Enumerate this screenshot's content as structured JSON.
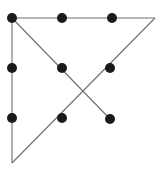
{
  "figure": {
    "type": "node-link-diagram",
    "canvas": {
      "width": 160,
      "height": 180,
      "background_color": "#ffffff"
    },
    "style": {
      "line_color": "#6e6e6e",
      "line_width": 1.1,
      "dot_color": "#1a1a1a",
      "dot_radius": 5
    },
    "nodes": [
      {
        "id": "n1",
        "label": "top-left",
        "x": 12,
        "y": 18,
        "marker": "dot"
      },
      {
        "id": "n2",
        "label": "top-middle",
        "x": 62,
        "y": 18,
        "marker": "dot"
      },
      {
        "id": "n3",
        "label": "top-right-inner",
        "x": 112,
        "y": 18,
        "marker": "dot"
      },
      {
        "id": "n4",
        "label": "left-middle",
        "x": 12,
        "y": 68,
        "marker": "dot"
      },
      {
        "id": "n5",
        "label": "center",
        "x": 62,
        "y": 68,
        "marker": "dot"
      },
      {
        "id": "n6",
        "label": "right-middle",
        "x": 110,
        "y": 68,
        "marker": "dot"
      },
      {
        "id": "n7",
        "label": "left-lower",
        "x": 12,
        "y": 118,
        "marker": "dot"
      },
      {
        "id": "n8",
        "label": "bottom-middle",
        "x": 62,
        "y": 118,
        "marker": "dot"
      },
      {
        "id": "n9",
        "label": "lower-right",
        "x": 110,
        "y": 119,
        "marker": "dot"
      }
    ],
    "corners": [
      {
        "id": "c1",
        "label": "top-right-corner",
        "x": 155,
        "y": 18,
        "marker": "none"
      },
      {
        "id": "c2",
        "label": "bottom-left-corner",
        "x": 12,
        "y": 163,
        "marker": "none"
      }
    ],
    "edges": [
      {
        "id": "e1",
        "label": "top-horizontal",
        "x1": 12,
        "y1": 18,
        "x2": 155,
        "y2": 18
      },
      {
        "id": "e2",
        "label": "left-vertical",
        "x1": 12,
        "y1": 18,
        "x2": 12,
        "y2": 163
      },
      {
        "id": "e3",
        "label": "diagonal-nw-se",
        "x1": 12,
        "y1": 18,
        "x2": 110,
        "y2": 119
      },
      {
        "id": "e4",
        "label": "diagonal-sw-ne",
        "x1": 12,
        "y1": 163,
        "x2": 155,
        "y2": 18
      }
    ],
    "intersections": [
      {
        "id": "x1",
        "label": "diagonal-crossing",
        "x": 86,
        "y": 93
      }
    ]
  }
}
